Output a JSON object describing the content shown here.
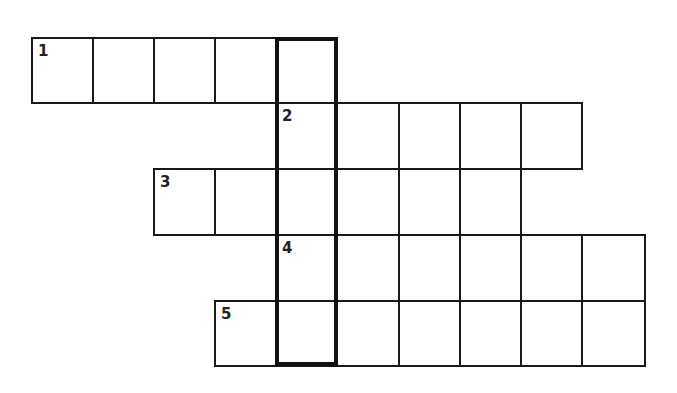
{
  "puzzle": {
    "type": "crossword",
    "cell_size": 61,
    "col_x": [
      31,
      92,
      153,
      214,
      275,
      336,
      398,
      459,
      520,
      581
    ],
    "row_y": [
      37,
      102,
      168,
      234,
      300
    ],
    "rows": [
      {
        "number": "1",
        "row": 0,
        "start_col": 0,
        "length": 5
      },
      {
        "number": "2",
        "row": 1,
        "start_col": 4,
        "length": 5
      },
      {
        "number": "3",
        "row": 2,
        "start_col": 2,
        "length": 6
      },
      {
        "number": "4",
        "row": 3,
        "start_col": 4,
        "length": 6
      },
      {
        "number": "5",
        "row": 4,
        "start_col": 3,
        "length": 7
      }
    ],
    "highlight_column": {
      "col": 4,
      "row_start": 0,
      "row_end": 4
    },
    "colors": {
      "line": "#1a1a1a",
      "background": "#ffffff",
      "highlight": "#111111"
    }
  }
}
